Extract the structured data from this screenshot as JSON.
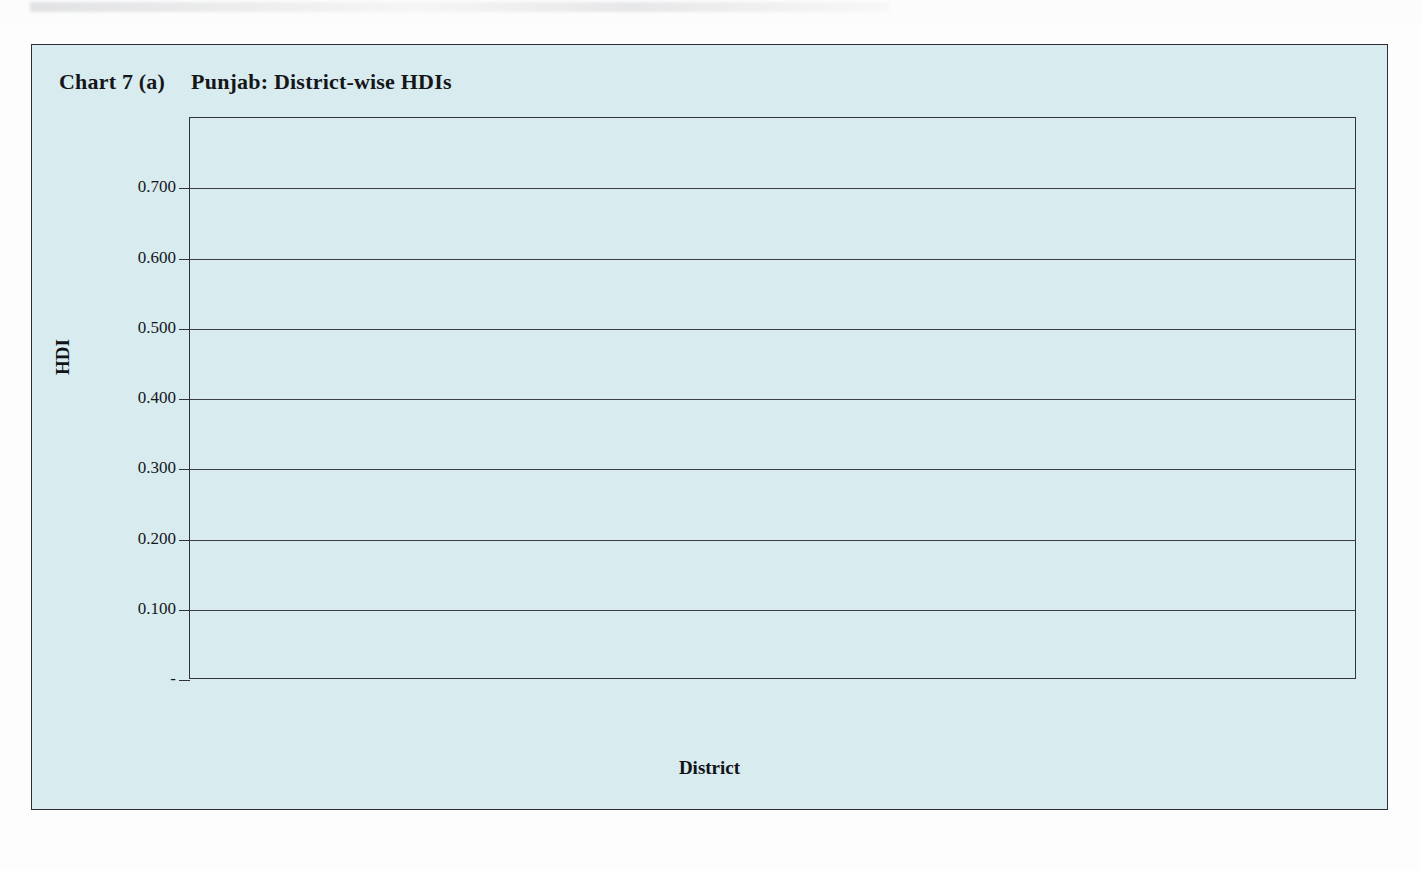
{
  "figure": {
    "label": "Chart 7 (a)",
    "title": "Punjab: District-wise HDIs"
  },
  "chart_data": {
    "type": "bar",
    "title": "Punjab: District-wise HDIs",
    "xlabel": "District",
    "ylabel": "HDI",
    "ylim": [
      0,
      0.8
    ],
    "grid": true,
    "legend": "none",
    "ytick_labels": [
      "0.700",
      "0.600",
      "0.500",
      "0.400",
      "0.300",
      "0.200",
      "0.100",
      "-"
    ],
    "ytick_values": [
      0.7,
      0.6,
      0.5,
      0.4,
      0.3,
      0.2,
      0.1,
      0.0
    ],
    "categories": [
      "Muzaffargarh",
      "Dera Ghazi Khan",
      "Narowal",
      "Lodhran",
      "Hafizabad",
      "Multan",
      "Pakpattan",
      "Bahawalpur",
      "Attock",
      "Vehari",
      "Khanewal",
      "Okara",
      "Jhang",
      "Gujranwala",
      "Sargodha",
      "Mianwali",
      "Rahim Yar Khan",
      "Sahiwal",
      "Gujrat",
      "Chakwal",
      "Sialkot",
      "Lahore",
      "Mandi Bahauddin",
      "Khusab",
      "Rawalpindi",
      "Kasur",
      "Bhakkar",
      "Sheikhupura",
      "Jhelum"
    ],
    "values": [
      0.462,
      0.479,
      0.48,
      0.48,
      0.493,
      0.501,
      0.501,
      0.509,
      0.511,
      0.516,
      0.524,
      0.537,
      0.538,
      0.539,
      0.548,
      0.544,
      0.554,
      0.554,
      0.555,
      0.555,
      0.563,
      0.569,
      0.578,
      0.587,
      0.587,
      0.587,
      0.592,
      0.638,
      0.721
    ]
  },
  "colors": {
    "panel_background": "#d8ebef",
    "bar_top": "#3e4f83",
    "bar_bottom": "#f7fbfc",
    "frame": "#2d2f35",
    "text": "#14161a"
  }
}
